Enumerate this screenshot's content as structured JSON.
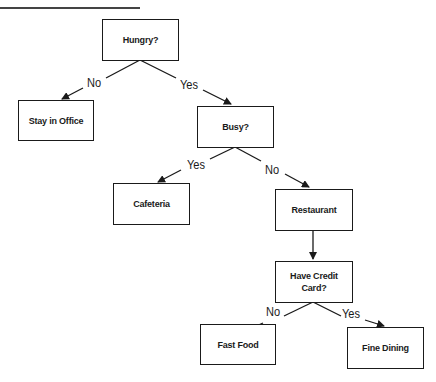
{
  "diagram": {
    "type": "decision-tree",
    "nodes": {
      "hungry": "Hungry?",
      "stay_office": "Stay in Office",
      "busy": "Busy?",
      "cafeteria": "Cafeteria",
      "restaurant": "Restaurant",
      "credit_card": "Have Credit Card?",
      "fast_food": "Fast Food",
      "fine_dining": "Fine Dining"
    },
    "edge_labels": {
      "hungry_no": "No",
      "hungry_yes": "Yes",
      "busy_yes": "Yes",
      "busy_no": "No",
      "card_no": "No",
      "card_yes": "Yes"
    },
    "edges": [
      {
        "from": "hungry",
        "to": "stay_office",
        "label": "No"
      },
      {
        "from": "hungry",
        "to": "busy",
        "label": "Yes"
      },
      {
        "from": "busy",
        "to": "cafeteria",
        "label": "Yes"
      },
      {
        "from": "busy",
        "to": "restaurant",
        "label": "No"
      },
      {
        "from": "restaurant",
        "to": "credit_card",
        "label": ""
      },
      {
        "from": "credit_card",
        "to": "fast_food",
        "label": "No"
      },
      {
        "from": "credit_card",
        "to": "fine_dining",
        "label": "Yes"
      }
    ],
    "colors": {
      "stroke": "#1a1a1a",
      "background": "#ffffff"
    }
  }
}
